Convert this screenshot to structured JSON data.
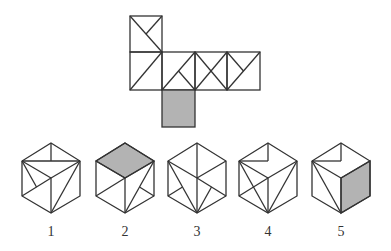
{
  "diagram": {
    "type": "cube-net-puzzle",
    "net": {
      "faces": [
        {
          "id": "top-square",
          "pattern": "diagonal-tl-br-with-half-from-tr"
        },
        {
          "id": "left-square",
          "pattern": "diagonal-tr-bl"
        },
        {
          "id": "center-square",
          "pattern": "diagonal-tr-bl-with-half-from-br"
        },
        {
          "id": "third-square",
          "pattern": "x-both-diagonals"
        },
        {
          "id": "right-square",
          "pattern": "diagonal-tr-bl-with-half-from-tl"
        },
        {
          "id": "bottom-square",
          "pattern": "shaded"
        }
      ]
    },
    "options": [
      {
        "label": "1"
      },
      {
        "label": "2"
      },
      {
        "label": "3"
      },
      {
        "label": "4"
      },
      {
        "label": "5"
      }
    ],
    "colors": {
      "line": "#333333",
      "shade": "#b3b3b3",
      "background": "#ffffff"
    }
  }
}
